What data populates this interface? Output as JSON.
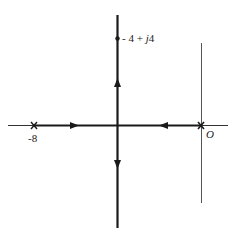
{
  "diagram": {
    "type": "root-locus",
    "colors": {
      "ink": "#1a1a1a",
      "thin_axis": "#555555",
      "background": "#ffffff"
    },
    "poles": [
      {
        "label": "-8",
        "value": -8,
        "marker": "x"
      },
      {
        "label": "O",
        "value": 0,
        "marker": "x"
      }
    ],
    "breakaway_point_label": "",
    "highlight_point": {
      "label_prefix": "- 4 + ",
      "label_j": "j",
      "label_suffix": "4",
      "full_label": "- 4 + j4",
      "real": -4,
      "imag": 4
    },
    "branches": [
      {
        "from": "-8",
        "direction": "right",
        "segment": "real-axis"
      },
      {
        "from": "0",
        "direction": "left",
        "segment": "real-axis"
      },
      {
        "from": "-4",
        "direction": "up",
        "segment": "vertical-asymptote"
      },
      {
        "from": "-4",
        "direction": "down",
        "segment": "vertical-asymptote"
      }
    ]
  }
}
